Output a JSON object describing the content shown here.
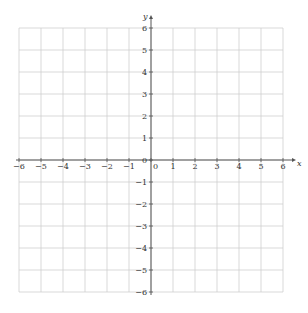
{
  "diagram": {
    "type": "cartesian-grid",
    "x_axis": {
      "label": "x",
      "min": -6,
      "max": 6,
      "ticks": [
        -6,
        -5,
        -4,
        -3,
        -2,
        -1,
        0,
        1,
        2,
        3,
        4,
        5,
        6
      ]
    },
    "y_axis": {
      "label": "y",
      "min": -6,
      "max": 6,
      "ticks": [
        -6,
        -5,
        -4,
        -3,
        -2,
        -1,
        0,
        1,
        2,
        3,
        4,
        5,
        6
      ]
    },
    "grid": true,
    "colors": {
      "grid": "#cfcfcf",
      "axis": "#555555",
      "text": "#333333"
    },
    "geometry": {
      "origin_x": 151,
      "origin_y": 160,
      "unit": 22
    }
  }
}
